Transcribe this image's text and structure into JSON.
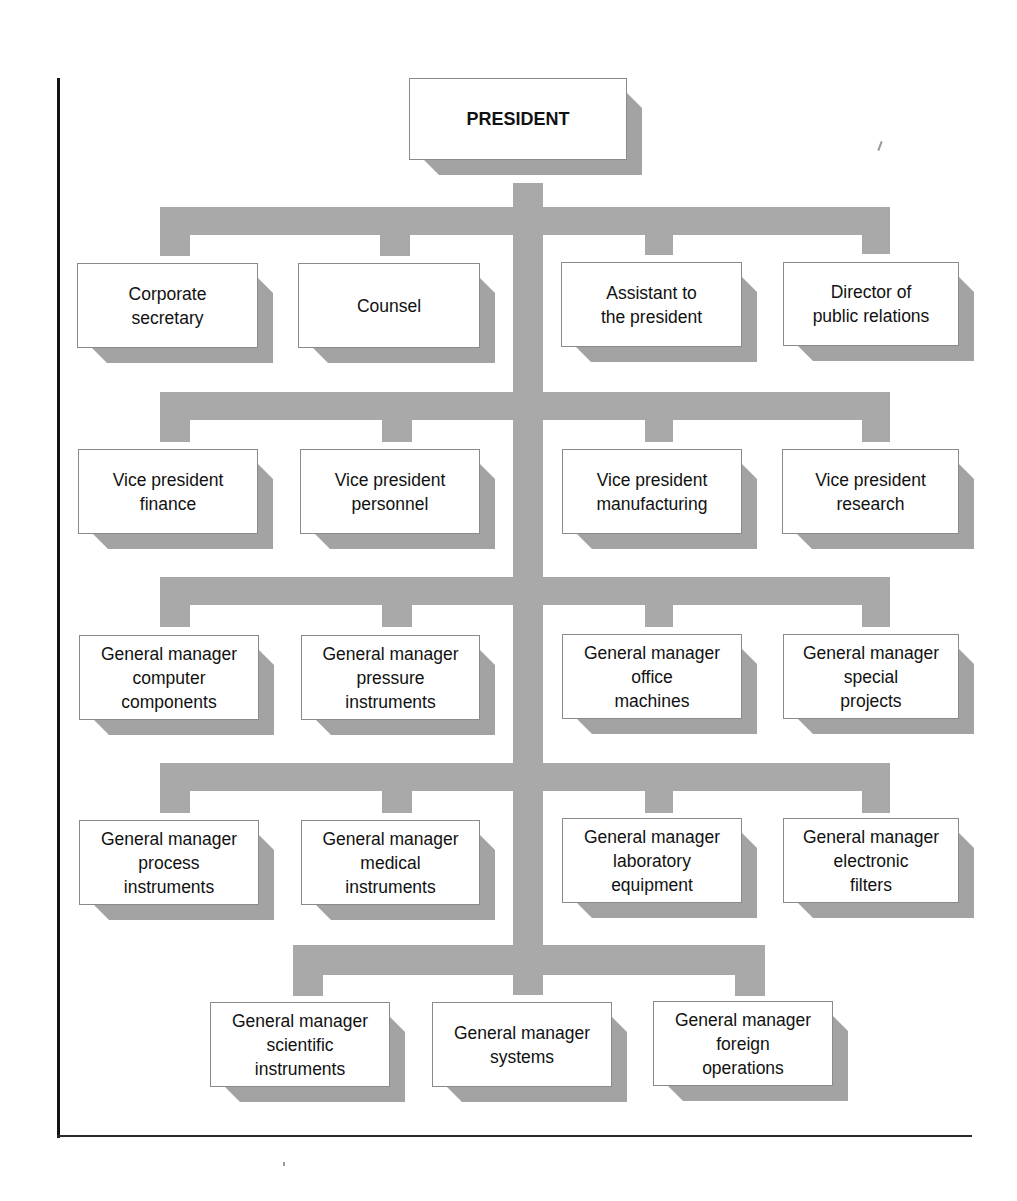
{
  "chart": {
    "title": "PRESIDENT",
    "staff_row": [
      "Corporate\nsecretary",
      "Counsel",
      "Assistant to\nthe president",
      "Director of\npublic relations"
    ],
    "vice_president_row": [
      "Vice president\nfinance",
      "Vice president\npersonnel",
      "Vice president\nmanufacturing",
      "Vice president\nresearch"
    ],
    "general_manager_row_1": [
      "General manager\ncomputer\ncomponents",
      "General manager\npressure\ninstruments",
      "General manager\noffice\nmachines",
      "General manager\nspecial\nprojects"
    ],
    "general_manager_row_2": [
      "General manager\nprocess\ninstruments",
      "General manager\nmedical\ninstruments",
      "General manager\nlaboratory\nequipment",
      "General manager\nelectronic\nfilters"
    ],
    "general_manager_row_3": [
      "General manager\nscientific\ninstruments",
      "General manager\nsystems",
      "General manager\nforeign\noperations"
    ]
  },
  "colors": {
    "connector": "#a9a9a9",
    "shadow": "#a3a3a3",
    "box_fill": "#ffffff",
    "frame": "#141414"
  }
}
